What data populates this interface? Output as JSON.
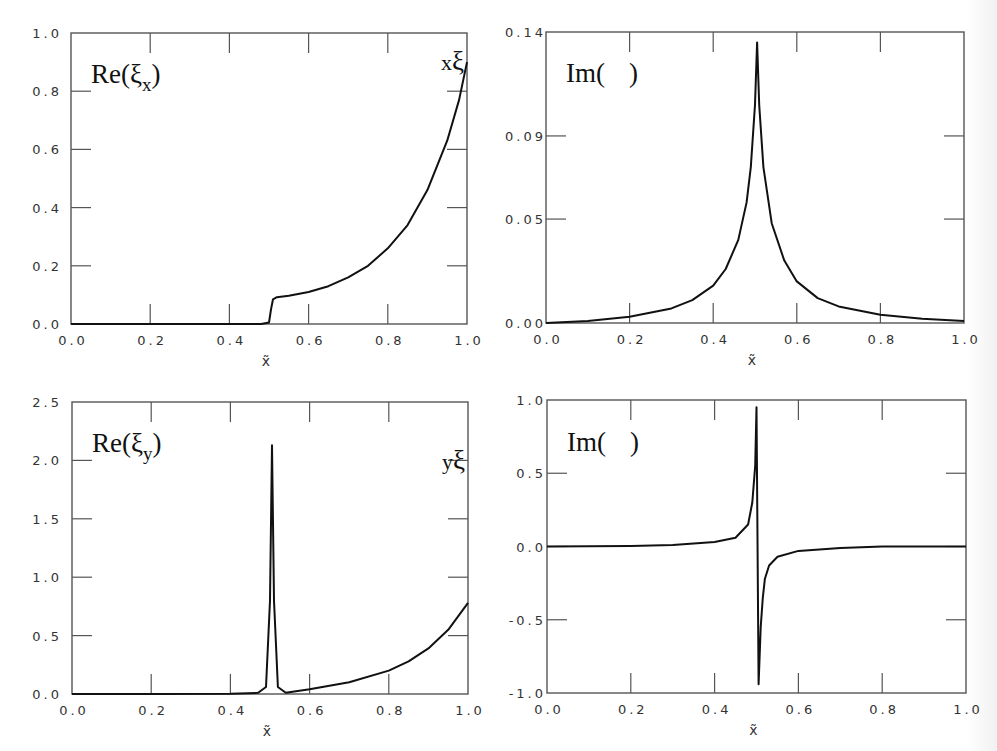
{
  "figure": {
    "layout": "2x2 panels",
    "colors": {
      "curve": "#111111",
      "axis": "#555555",
      "text": "#333333",
      "background": "#ffffff"
    }
  },
  "panels": [
    {
      "id": "re-xi-x",
      "label_main": "Re(ξ",
      "label_sub": "x",
      "label_close": ")",
      "corner_label_prefix": "x",
      "corner_label_symbol": "ξ",
      "xlabel": "x̃",
      "xticks": [
        "0.0",
        "0.2",
        "0.4",
        "0.6",
        "0.8",
        "1.0"
      ],
      "yticks": [
        "0.0",
        "0.2",
        "0.4",
        "0.6",
        "0.8",
        "1.0"
      ]
    },
    {
      "id": "im-xi-x",
      "label_main": "Im(",
      "label_sub": "",
      "label_close": ")",
      "xlabel": "x̃",
      "xticks": [
        "0.0",
        "0.2",
        "0.4",
        "0.6",
        "0.8",
        "1.0"
      ],
      "yticks": [
        "0.00",
        "0.05",
        "0.09",
        "0.14"
      ]
    },
    {
      "id": "re-xi-y",
      "label_main": "Re(ξ",
      "label_sub": "y",
      "label_close": ")",
      "corner_label_prefix": "y",
      "corner_label_symbol": "ξ",
      "xlabel": "x̃",
      "xticks": [
        "0.0",
        "0.2",
        "0.4",
        "0.6",
        "0.8",
        "1.0"
      ],
      "yticks": [
        "0.0",
        "0.5",
        "1.0",
        "1.5",
        "2.0",
        "2.5"
      ]
    },
    {
      "id": "im-xi-y",
      "label_main": "Im(",
      "label_sub": "",
      "label_close": ")",
      "xlabel": "x̃",
      "xticks": [
        "0.0",
        "0.2",
        "0.4",
        "0.6",
        "0.8",
        "1.0"
      ],
      "yticks": [
        "-1.0",
        "-0.5",
        "0.0",
        "0.5",
        "1.0"
      ]
    }
  ],
  "chart_data": [
    {
      "type": "line",
      "title": "Re(ξx)",
      "xlabel": "x̃",
      "ylabel": "",
      "xlim": [
        0,
        1
      ],
      "ylim": [
        0,
        1.0
      ],
      "grid": false,
      "yticks": [
        0,
        0.2,
        0.4,
        0.6,
        0.8,
        1.0
      ],
      "xticks": [
        0,
        0.2,
        0.4,
        0.6,
        0.8,
        1.0
      ],
      "annotations": [
        "Re(ξx)",
        "xξ"
      ],
      "series": [
        {
          "name": "Re(ξx)",
          "x": [
            0.0,
            0.1,
            0.2,
            0.3,
            0.4,
            0.48,
            0.5,
            0.505,
            0.51,
            0.52,
            0.55,
            0.6,
            0.65,
            0.7,
            0.75,
            0.8,
            0.85,
            0.9,
            0.95,
            0.98,
            1.0
          ],
          "y": [
            0.0,
            0.0,
            0.0,
            0.0,
            0.0,
            0.0,
            0.005,
            0.05,
            0.085,
            0.092,
            0.097,
            0.11,
            0.13,
            0.16,
            0.2,
            0.26,
            0.34,
            0.46,
            0.63,
            0.77,
            0.9
          ]
        }
      ]
    },
    {
      "type": "line",
      "title": "Im()",
      "xlabel": "x̃",
      "ylabel": "",
      "xlim": [
        0,
        1
      ],
      "ylim": [
        0,
        0.14
      ],
      "grid": false,
      "yticks": [
        0.0,
        0.05,
        0.09,
        0.14
      ],
      "xticks": [
        0,
        0.2,
        0.4,
        0.6,
        0.8,
        1.0
      ],
      "annotations": [
        "Im( )"
      ],
      "series": [
        {
          "name": "Im(ξx)",
          "x": [
            0.0,
            0.1,
            0.2,
            0.3,
            0.35,
            0.4,
            0.43,
            0.46,
            0.48,
            0.49,
            0.5,
            0.505,
            0.51,
            0.52,
            0.54,
            0.57,
            0.6,
            0.65,
            0.7,
            0.8,
            0.9,
            1.0
          ],
          "y": [
            0.0,
            0.001,
            0.003,
            0.007,
            0.011,
            0.018,
            0.026,
            0.04,
            0.058,
            0.075,
            0.105,
            0.135,
            0.105,
            0.075,
            0.048,
            0.03,
            0.02,
            0.012,
            0.008,
            0.004,
            0.002,
            0.001
          ]
        }
      ]
    },
    {
      "type": "line",
      "title": "Re(ξy)",
      "xlabel": "x̃",
      "ylabel": "",
      "xlim": [
        0,
        1
      ],
      "ylim": [
        0,
        2.5
      ],
      "grid": false,
      "yticks": [
        0,
        0.5,
        1.0,
        1.5,
        2.0,
        2.5
      ],
      "xticks": [
        0,
        0.2,
        0.4,
        0.6,
        0.8,
        1.0
      ],
      "annotations": [
        "Re(ξy)",
        "yξ"
      ],
      "series": [
        {
          "name": "Re(ξy)",
          "x": [
            0.0,
            0.2,
            0.4,
            0.47,
            0.49,
            0.5,
            0.505,
            0.51,
            0.52,
            0.54,
            0.6,
            0.7,
            0.8,
            0.85,
            0.9,
            0.95,
            1.0
          ],
          "y": [
            0.0,
            0.0,
            0.002,
            0.01,
            0.06,
            0.8,
            2.13,
            0.8,
            0.06,
            0.01,
            0.04,
            0.1,
            0.2,
            0.28,
            0.39,
            0.55,
            0.78
          ]
        }
      ]
    },
    {
      "type": "line",
      "title": "Im()",
      "xlabel": "x̃",
      "ylabel": "",
      "xlim": [
        0,
        1
      ],
      "ylim": [
        -1.0,
        1.0
      ],
      "grid": false,
      "yticks": [
        -1.0,
        -0.5,
        0.0,
        0.5,
        1.0
      ],
      "xticks": [
        0,
        0.2,
        0.4,
        0.6,
        0.8,
        1.0
      ],
      "annotations": [
        "Im( )"
      ],
      "series": [
        {
          "name": "Im(ξy)",
          "x": [
            0.0,
            0.2,
            0.3,
            0.4,
            0.45,
            0.48,
            0.49,
            0.497,
            0.5,
            0.505,
            0.51,
            0.515,
            0.52,
            0.53,
            0.55,
            0.6,
            0.7,
            0.8,
            1.0
          ],
          "y": [
            0.0,
            0.003,
            0.01,
            0.03,
            0.06,
            0.15,
            0.3,
            0.55,
            0.95,
            -0.94,
            -0.55,
            -0.35,
            -0.22,
            -0.13,
            -0.07,
            -0.03,
            -0.01,
            0.0,
            0.0
          ]
        }
      ]
    }
  ]
}
